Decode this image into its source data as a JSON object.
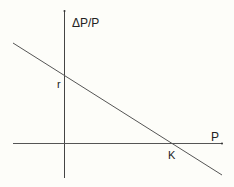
{
  "diagram": {
    "type": "linear relationship",
    "y_axis_label": "ΔP/P",
    "x_axis_label": "P",
    "y_intercept_label": "r",
    "x_intercept_label": "K",
    "colors": {
      "background": "#fdfdf9",
      "axis": "#444444",
      "line": "#555555",
      "text": "#222222"
    }
  }
}
